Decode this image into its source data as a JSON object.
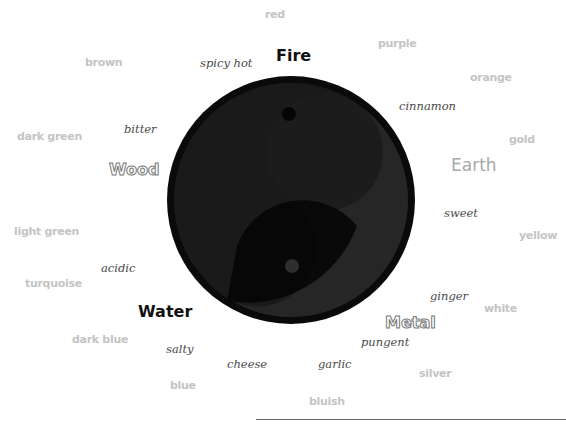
{
  "diagram": {
    "type": "five-elements-yin-yang",
    "elements": {
      "fire": "Fire",
      "earth": "Earth",
      "metal": "Metal",
      "water": "Water",
      "wood": "Wood"
    },
    "tastes": {
      "spicy_hot": "spicy hot",
      "cinnamon": "cinnamon",
      "sweet": "sweet",
      "ginger": "ginger",
      "pungent": "pungent",
      "garlic": "garlic",
      "cheese": "cheese",
      "salty": "salty",
      "acidic": "acidic",
      "bitter": "bitter"
    },
    "colors": {
      "red": "red",
      "purple": "purple",
      "orange": "orange",
      "gold": "gold",
      "yellow": "yellow",
      "white": "white",
      "silver": "silver",
      "bluish": "bluish",
      "blue": "blue",
      "dark_blue": "dark blue",
      "turquoise": "turquoise",
      "light_green": "light green",
      "dark_green": "dark green",
      "brown": "brown"
    },
    "palette": {
      "circle_outer": "#0a0a0a",
      "yin_light": "#242424",
      "yang_dark": "#060606",
      "color_label": "#c4c4c4",
      "taste_label": "#4a4a4a"
    }
  }
}
